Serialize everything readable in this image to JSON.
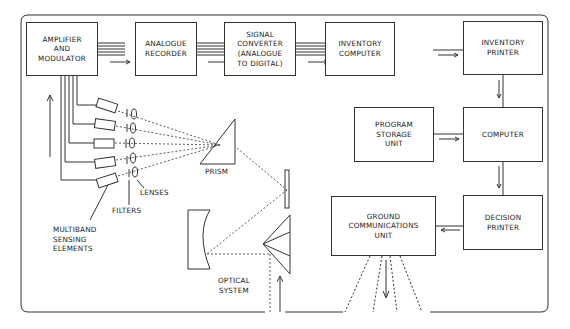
{
  "diagram": {
    "type": "block-flow",
    "boxes": {
      "amplifier": "AMPLIFIER\nAND\nMODULATOR",
      "analogue_recorder": "ANALOGUE\nRECORDER",
      "signal_converter": "SIGNAL\nCONVERTER\n(ANALOGUE\nTO DIGITAL)",
      "inventory_computer": "INVENTORY\nCOMPUTER",
      "inventory_printer": "INVENTORY\nPRINTER",
      "program_storage": "PROGRAM\nSTORAGE\nUNIT",
      "computer": "COMPUTER",
      "decision_printer": "DECISION\nPRINTER",
      "ground_comm": "GROUND\nCOMMUNICATIONS\nUNIT"
    },
    "labels": {
      "prism": "PRISM",
      "lenses": "LENSES",
      "filters": "FILTERS",
      "sensing": "MULTIBAND\nSENSING\nELEMENTS",
      "optical": "OPTICAL\nSYSTEM"
    },
    "line_color": "#333333"
  }
}
